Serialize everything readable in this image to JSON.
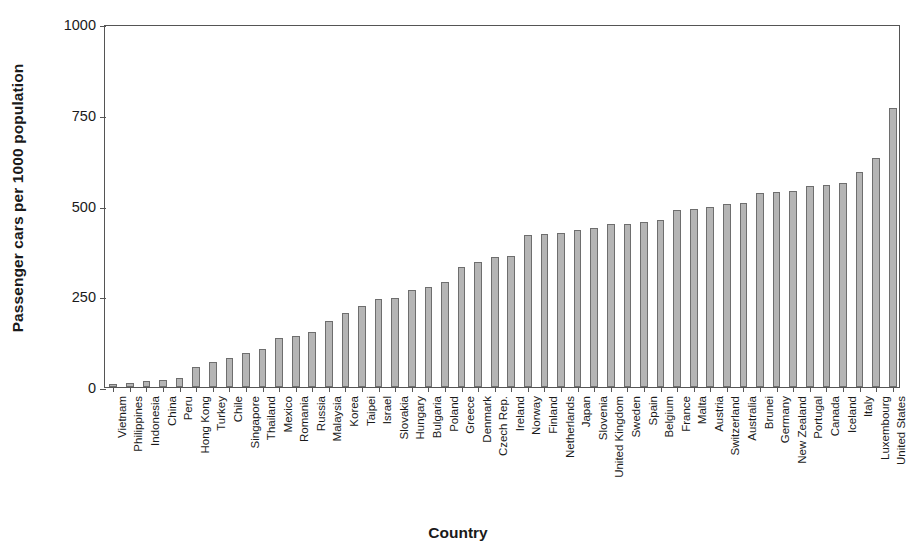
{
  "chart_data": {
    "type": "bar",
    "title": "",
    "xlabel": "Country",
    "ylabel": "Passenger cars per 1000 population",
    "ylim": [
      0,
      1000
    ],
    "yticks": [
      0,
      250,
      500,
      750,
      1000
    ],
    "ytick_labels": [
      "0",
      "250",
      "500",
      "750",
      "1000"
    ],
    "grid": false,
    "legend": "none",
    "bar_color": "#b5b5b5",
    "bar_edge_color": "#6e6e6e",
    "axis_color": "#555555",
    "categories": [
      "Vietnam",
      "Philippines",
      "Indonesia",
      "China",
      "Peru",
      "Hong Kong",
      "Turkey",
      "Chile",
      "Singapore",
      "Thailand",
      "Mexico",
      "Romania",
      "Russia",
      "Malaysia",
      "Korea",
      "Taipei",
      "Israel",
      "Slovakia",
      "Hungary",
      "Bulgaria",
      "Poland",
      "Greece",
      "Denmark",
      "Czech Rep.",
      "Ireland",
      "Norway",
      "Finland",
      "Netherlands",
      "Japan",
      "Slovenia",
      "United Kingdom",
      "Sweden",
      "Spain",
      "Belgium",
      "France",
      "Malta",
      "Austria",
      "Switzerland",
      "Australia",
      "Brunei",
      "Germany",
      "New Zealand",
      "Portugal",
      "Canada",
      "Iceland",
      "Italy",
      "Luxembourg",
      "United States"
    ],
    "values": [
      7,
      10,
      17,
      18,
      25,
      55,
      70,
      80,
      95,
      105,
      135,
      140,
      152,
      182,
      205,
      222,
      243,
      244,
      268,
      275,
      288,
      330,
      345,
      358,
      362,
      418,
      422,
      423,
      432,
      438,
      448,
      450,
      455,
      460,
      488,
      490,
      495,
      505,
      508,
      535,
      538,
      540,
      555,
      557,
      562,
      592,
      632,
      768
    ]
  },
  "axes": {
    "y_title": "Passenger cars per 1000 population",
    "x_title": "Country"
  }
}
